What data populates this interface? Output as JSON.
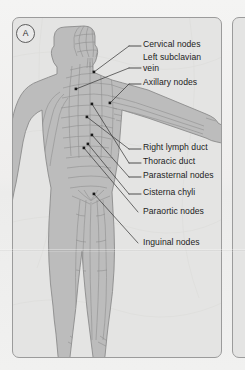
{
  "figure": {
    "panel_tag": "A",
    "colors": {
      "page_background": "#f1f1f0",
      "panel_fill": "#e4e4e3",
      "panel_border": "#9b9b9b",
      "body_fill": "#b9b9b9",
      "body_outline": "#8e8e8e",
      "vessel": "#8a8a8a",
      "leader_line": "#3c3c3c",
      "anchor_dot": "#171717",
      "label_text": "#1c1c1c"
    },
    "labels": [
      {
        "id": "cervical-nodes",
        "text": "Cervical nodes",
        "x": 143,
        "y": 42,
        "dash_x1": 129,
        "dash_x2": 141,
        "dash_y": 46,
        "anchor_x": 94,
        "anchor_y": 72
      },
      {
        "id": "left-subclavian-vein",
        "text": "Left subclavian",
        "x": 143,
        "y": 55,
        "dash_x1": 129,
        "dash_x2": 141,
        "dash_y": 68,
        "anchor_x": 76,
        "anchor_y": 89
      },
      {
        "id": "left-subclavian-vein-2",
        "text": "vein",
        "x": 143,
        "y": 66,
        "dash_x1": null,
        "dash_x2": null,
        "dash_y": null,
        "anchor_x": null,
        "anchor_y": null
      },
      {
        "id": "axillary-nodes",
        "text": "Axillary nodes",
        "x": 143,
        "y": 80,
        "dash_x1": 129,
        "dash_x2": 141,
        "dash_y": 84,
        "anchor_x": 110,
        "anchor_y": 103
      },
      {
        "id": "right-lymph-duct",
        "text": "Right lymph duct",
        "x": 143,
        "y": 145,
        "dash_x1": 129,
        "dash_x2": 141,
        "dash_y": 149,
        "anchor_x": 87,
        "anchor_y": 117
      },
      {
        "id": "thoracic-duct",
        "text": "Thoracic duct",
        "x": 143,
        "y": 159,
        "dash_x1": 129,
        "dash_x2": 141,
        "dash_y": 163,
        "anchor_x": 92,
        "anchor_y": 104
      },
      {
        "id": "parasternal-nodes",
        "text": "Parasternal nodes",
        "x": 143,
        "y": 173,
        "dash_x1": 129,
        "dash_x2": 141,
        "dash_y": 177,
        "anchor_x": 92,
        "anchor_y": 135
      },
      {
        "id": "cisterna-chyli",
        "text": "Cisterna chyli",
        "x": 143,
        "y": 190,
        "dash_x1": 129,
        "dash_x2": 141,
        "dash_y": 194,
        "anchor_x": 88,
        "anchor_y": 144
      },
      {
        "id": "paraortic-nodes",
        "text": "Paraortic nodes",
        "x": 143,
        "y": 213,
        "dash_x1": null,
        "dash_x2": null,
        "dash_y": null,
        "anchor_x": 84,
        "anchor_y": 148
      },
      {
        "id": "inguinal-nodes",
        "text": "Inguinal nodes",
        "x": 143,
        "y": 244,
        "dash_x1": null,
        "dash_x2": null,
        "dash_y": null,
        "anchor_x": 94,
        "anchor_y": 194
      }
    ]
  }
}
